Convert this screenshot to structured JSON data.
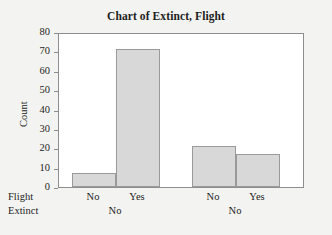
{
  "chart_data": {
    "type": "bar",
    "title": "Chart of Extinct, Flight",
    "xlabel": "",
    "ylabel": "Count",
    "ylim": [
      0,
      80
    ],
    "ytick_step": 10,
    "yticks": [
      80,
      70,
      60,
      50,
      40,
      30,
      20,
      10,
      0
    ],
    "grid": false,
    "legend": null,
    "categories": [
      "No",
      "Yes",
      "No",
      "Yes"
    ],
    "values": [
      7,
      71,
      21,
      17
    ],
    "bars": [
      {
        "label": "No",
        "value": 7,
        "group": "No"
      },
      {
        "label": "Yes",
        "value": 71,
        "group": "No"
      },
      {
        "label": "No",
        "value": 21,
        "group": "No"
      },
      {
        "label": "Yes",
        "value": 17,
        "group": "No"
      }
    ],
    "group_levels": [
      "No",
      "No"
    ],
    "axis_row_names": [
      "Flight",
      "Extinct"
    ],
    "bar_fill": "#d8d8d8",
    "bar_border": "#9a9a9a",
    "plot_background": "#ffffff",
    "figure_background": "#f3f3f1",
    "frame_color": "#8d8d8d"
  },
  "figure": {
    "title": "Chart of Extinct, Flight",
    "y_axis_title": "Count",
    "row_label_flight": "Flight",
    "row_label_extinct": "Extinct"
  }
}
